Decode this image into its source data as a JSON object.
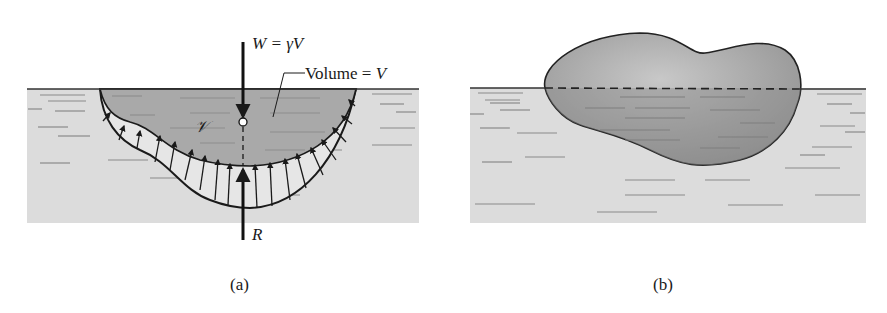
{
  "figure": {
    "panels": [
      {
        "id": "a",
        "caption": "(a)",
        "labels": {
          "weight": "W = γV",
          "volume": "—Volume = V",
          "volume_symbol": "𝒱",
          "reaction": "R"
        },
        "elements": [
          "water-surface",
          "submerged-body",
          "pressure-distribution-arrows",
          "weight-arrow",
          "reaction-arrow",
          "centroid-point",
          "dashed-line-of-action"
        ]
      },
      {
        "id": "b",
        "caption": "(b)",
        "elements": [
          "water-surface",
          "floating-body",
          "dashed-waterline"
        ]
      }
    ],
    "colors": {
      "water": "#dcdcdc",
      "body_submerged": "#a9a9a9",
      "body_above": "#b8b8b8",
      "outline": "#222222",
      "ripple": "#8a8a8a",
      "background": "#ffffff"
    }
  }
}
